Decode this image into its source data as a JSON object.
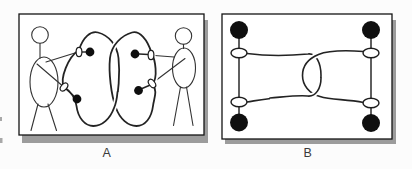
{
  "figure": {
    "type": "two-panel book illustration, linked-loops topology puzzle",
    "background": "#fcfcfc",
    "colors": {
      "ink": "#232323",
      "frame": "#141414",
      "drop_shadow": "#9c9c9c",
      "label": "#3a3a3a",
      "node_fill": "#0f0f0f",
      "panel_fill": "#ffffff"
    },
    "panels": [
      {
        "label": "A",
        "description": "Two stick figures facing each other; each wears cuff rings on the wrists with knotted cords, and the two cords form large interlinked loops",
        "stick_figures": 2,
        "wrist_rings": 4,
        "knot_dots": 4,
        "interlocked_loops": 2
      },
      {
        "label": "B",
        "description": "Abstract schematic of the same link: two vertical bars, each ending in filled nodes with open rings, joined by two interlocking cord loops",
        "vertical_bars": 2,
        "filled_nodes": 4,
        "open_rings": 4,
        "interlocked_loops": 2
      }
    ]
  }
}
